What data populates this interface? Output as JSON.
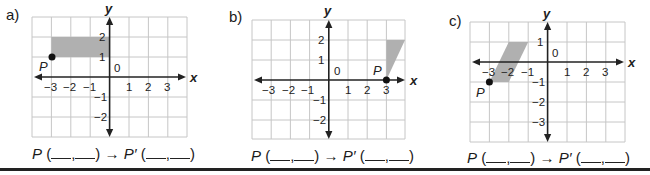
{
  "panels": [
    {
      "label": "a)",
      "x_axis_label": "x",
      "y_axis_label": "y",
      "origin_label": "0",
      "x_ticks": [
        "−3",
        "−2",
        "−1",
        "1",
        "2",
        "3"
      ],
      "y_ticks": [
        "2",
        "1",
        "−1",
        "−2"
      ],
      "point_label": "P",
      "point": [
        -3,
        1
      ],
      "shape": "rectangle",
      "shape_vertices": [
        [
          -3,
          1
        ],
        [
          -3,
          2
        ],
        [
          0,
          2
        ],
        [
          0,
          1
        ]
      ],
      "expression": {
        "p": "P",
        "open": "(",
        "comma": ",",
        "close": ")",
        "arrow": "→",
        "p_prime": "P′"
      }
    },
    {
      "label": "b)",
      "x_axis_label": "x",
      "y_axis_label": "y",
      "origin_label": "0",
      "x_ticks": [
        "−3",
        "−2",
        "−1",
        "1",
        "2",
        "3"
      ],
      "y_ticks": [
        "2",
        "1",
        "−1",
        "−2"
      ],
      "point_label": "P",
      "point": [
        3,
        0
      ],
      "shape": "triangle",
      "shape_vertices": [
        [
          3,
          0
        ],
        [
          3,
          2
        ],
        [
          4,
          2
        ]
      ],
      "expression": {
        "p": "P",
        "open": "(",
        "comma": ",",
        "close": ")",
        "arrow": "→",
        "p_prime": "P′"
      }
    },
    {
      "label": "c)",
      "x_axis_label": "x",
      "y_axis_label": "y",
      "origin_label": "0",
      "x_ticks": [
        "−3",
        "−2",
        "−1",
        "1",
        "2",
        "3"
      ],
      "y_ticks": [
        "1",
        "−1",
        "−2",
        "−3"
      ],
      "point_label": "P",
      "point": [
        -3,
        -1
      ],
      "shape": "parallelogram",
      "shape_vertices": [
        [
          -3,
          -1
        ],
        [
          -2,
          -1
        ],
        [
          -1,
          1
        ],
        [
          -2,
          1
        ]
      ],
      "expression": {
        "p": "P",
        "open": "(",
        "comma": ",",
        "close": ")",
        "arrow": "→",
        "p_prime": "P′"
      }
    }
  ],
  "colors": {
    "shape_fill": "#b0b0b0",
    "grid": "#c6c6c6",
    "axis": "#222222"
  }
}
